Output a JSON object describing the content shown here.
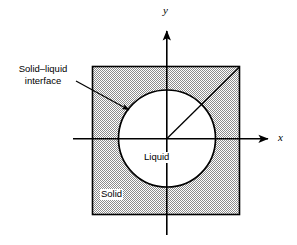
{
  "figure": {
    "type": "diagram",
    "title": "",
    "background_color": "#ffffff",
    "line_color": "#000000",
    "fill_color": "#c8c8c8",
    "axes": {
      "x_label": "x",
      "y_label": "y",
      "origin": {
        "x": 167,
        "y": 139
      }
    },
    "regions": [
      {
        "id": "solid",
        "label": "Solid",
        "shape": "square",
        "shaded": true
      },
      {
        "id": "liquid",
        "label": "Liquid",
        "shape": "circle",
        "shaded": false
      }
    ],
    "annotation": {
      "line1": "Solid–liquid",
      "line2": "interface",
      "target": "circle-boundary"
    },
    "radius_line": {
      "from": "origin",
      "to": "square-top-right-corner"
    }
  }
}
